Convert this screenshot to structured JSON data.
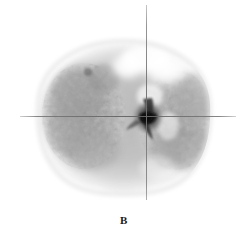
{
  "panel": {
    "label": "B",
    "modality_caption": "",
    "orientation": "axial"
  },
  "colors": {
    "background": "#ffffff",
    "crosshair": "#8e8e8e",
    "tissue_mid": "#b4b4b4",
    "tissue_dark": "#4a4a4a",
    "defect_bright": "#fdfdfd",
    "label_text": "#1a1a1a"
  },
  "crosshair": {
    "vertical_x": 146,
    "vertical_top": 5,
    "vertical_bottom": 218,
    "horizontal_y": 116,
    "horizontal_left": 20,
    "horizontal_right": 236
  },
  "scan": {
    "width": 248,
    "height": 200,
    "body_center_x": 124,
    "body_center_y": 117,
    "body_radius_x": 88,
    "body_radius_y": 76,
    "features": [
      {
        "name": "mediastinal-core",
        "x": 148,
        "y": 118,
        "intensity": "dark"
      },
      {
        "name": "left-lung-field",
        "x": 82,
        "y": 115,
        "intensity": "mid"
      },
      {
        "name": "right-lung-field",
        "x": 178,
        "y": 120,
        "intensity": "mid"
      },
      {
        "name": "upper-right-defect",
        "x": 168,
        "y": 70,
        "intensity": "bright"
      },
      {
        "name": "upper-mid-defect",
        "x": 130,
        "y": 68,
        "intensity": "bright"
      }
    ]
  }
}
